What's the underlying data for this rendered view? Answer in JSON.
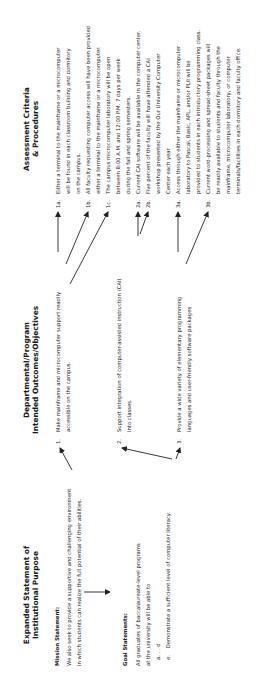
{
  "columns": {
    "purpose": {
      "heading_line1": "Expanded Statement of",
      "heading_line2": "Institutional Purpose",
      "mission_label": "Mission Statement:",
      "mission_text_1": "We also seek to provide a supportive and challenging environment",
      "mission_text_2": "in which students can realize the full potential of their abilities.",
      "goal_label": "Goal Statements:",
      "goal_text_1": "All graduates of baccalaureate-level programs",
      "goal_text_2": "at the university will be able to",
      "goal_a": "a. . . d",
      "goal_e_marker": "e.",
      "goal_e_text": "Demonstrate a sufficient level of computer literacy."
    },
    "outcomes": {
      "heading_line1": "Departmental/Program",
      "heading_line2": "Intended Outcomes/Objectives",
      "items": [
        {
          "num": "1.",
          "line1": "Make mainframe and microcomputer support readily",
          "line2": "accessible on the campus."
        },
        {
          "num": "2.",
          "line1": "Support integration of computer-assisted instruction (CAI)",
          "line2": "into classes."
        },
        {
          "num": "3.",
          "line1": "Provide a wide variety of elementary programming",
          "line2": "languages and user-friendly software packages"
        }
      ]
    },
    "assessment": {
      "heading_line1": "Assessment Criteria",
      "heading_line2": "& Procedures",
      "criteria": [
        {
          "num": "1a.",
          "lines": [
            "Either a terminal to the mainframe or a microcomputer",
            "will be found in each classroom building and dormitory",
            "on the campus."
          ]
        },
        {
          "num": "1b.",
          "lines": [
            "All faculty requesting computer access will have been provided",
            "either a terminal to the mainframe or a microcomputer."
          ]
        },
        {
          "num": "1c.",
          "lines": [
            "The campus microcomputer laboratory will be open",
            "between 8:00 A.M. and 12:00 P.M. 7 days per week",
            "during the fall and spring semesters."
          ]
        },
        {
          "num": "2a.",
          "lines": [
            "Current CAI software will be available in the computer center."
          ]
        },
        {
          "num": "2b.",
          "lines": [
            "Five percent of the faculty will have attended a CAI",
            "workshop presented by the Our University Computer",
            "Center each year"
          ]
        },
        {
          "num": "3a.",
          "lines": [
            "Access through either the mainframe or microcomputer",
            "laboratory to Pascal, Basic, APL, and/or PL/I will be",
            "provided to students in each introductory programming class."
          ]
        },
        {
          "num": "3b.",
          "lines": [
            "Current word-processing and spread-sheet packages will",
            "be readily available to students and faculty through the",
            "mainframe, microcomputer laboratory, or computer",
            "terminals/facilities in each dormitory and faculty office."
          ]
        }
      ]
    }
  },
  "colors": {
    "text": "#222222",
    "arrow": "#222222",
    "background": "#ffffff"
  }
}
